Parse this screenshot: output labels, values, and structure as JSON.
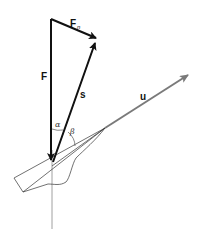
{
  "diagram": {
    "title": "",
    "type": "vector-force-diagram",
    "labels": {
      "F": "F",
      "Fn_main": "F",
      "Fn_sub": "n",
      "s": "s",
      "u": "u",
      "alpha": "α",
      "beta": "β"
    },
    "colors": {
      "main_vectors": "#111111",
      "u_vector": "#808080",
      "outline": "#333333",
      "axis_line": "#888888",
      "background": "#ffffff"
    },
    "vectors": [
      {
        "name": "F",
        "from": [
          51,
          19
        ],
        "to": [
          51,
          160
        ],
        "style": "bold-black"
      },
      {
        "name": "Fn",
        "from": [
          51,
          19
        ],
        "to": [
          96,
          38
        ],
        "style": "bold-black"
      },
      {
        "name": "s",
        "from": [
          52,
          162
        ],
        "to": [
          96,
          42
        ],
        "style": "bold-black"
      },
      {
        "name": "u",
        "from": [
          105,
          128
        ],
        "to": [
          189,
          74
        ],
        "style": "gray"
      }
    ],
    "angles": [
      {
        "name": "alpha",
        "between": [
          "F",
          "s"
        ]
      },
      {
        "name": "beta",
        "between": [
          "s",
          "u"
        ]
      }
    ]
  }
}
